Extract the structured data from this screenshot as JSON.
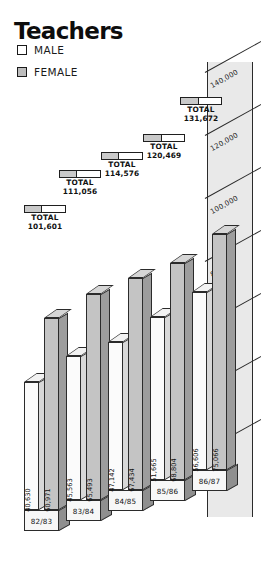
{
  "title": "Teachers",
  "legend": {
    "items": [
      {
        "label": "MALE",
        "swatch": "legend-swatch-male",
        "color": "#ffffff"
      },
      {
        "label": "FEMALE",
        "swatch": "legend-swatch-female",
        "color": "#bdbdbd"
      }
    ]
  },
  "axis": {
    "gridlabels": [
      "140,000",
      "120,000",
      "100,000",
      "80,000",
      "60,000",
      "40,000",
      "20,000"
    ]
  },
  "totals": [
    {
      "word": "TOTAL",
      "value": "101,601"
    },
    {
      "word": "TOTAL",
      "value": "111,056"
    },
    {
      "word": "TOTAL",
      "value": "114,576"
    },
    {
      "word": "TOTAL",
      "value": "120,469"
    },
    {
      "word": "TOTAL",
      "value": "131,672"
    }
  ],
  "years": [
    "82/83",
    "83/84",
    "84/85",
    "85/86",
    "86/87"
  ],
  "bars": {
    "male": [
      "40,630",
      "45,563",
      "47,142",
      "51,665",
      "56,606"
    ],
    "female": [
      "60,971",
      "65,493",
      "67,434",
      "68,804",
      "75,066"
    ]
  },
  "chart_data": {
    "type": "bar",
    "title": "Teachers",
    "xlabel": "",
    "ylabel": "",
    "categories": [
      "82/83",
      "83/84",
      "84/85",
      "85/86",
      "86/87"
    ],
    "series": [
      {
        "name": "MALE",
        "values": [
          40630,
          45563,
          47142,
          51665,
          56606
        ]
      },
      {
        "name": "FEMALE",
        "values": [
          60971,
          65493,
          67434,
          68804,
          75066
        ]
      }
    ],
    "totals": [
      101601,
      111056,
      114576,
      120469,
      131672
    ],
    "ylim": [
      0,
      140000
    ],
    "yticks": [
      20000,
      40000,
      60000,
      80000,
      100000,
      120000,
      140000
    ],
    "ytick_labels": [
      "20,000",
      "40,000",
      "60,000",
      "80,000",
      "100,000",
      "120,000",
      "140,000"
    ],
    "grid": true,
    "legend": "top-left",
    "annotations": [
      "TOTAL 101,601",
      "TOTAL 111,056",
      "TOTAL 114,576",
      "TOTAL 120,469",
      "TOTAL 131,672"
    ],
    "style": "3d-isometric-grouped-bar"
  }
}
